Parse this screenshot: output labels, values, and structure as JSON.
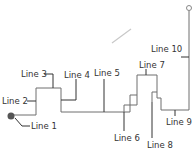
{
  "diagram": {
    "colors": {
      "line": "#6e6e6e",
      "leader": "#333333",
      "label": "#333333",
      "start_dot": "#555555",
      "end_circle": "#888888",
      "stray_stroke": "#c8c8c8"
    },
    "labels": [
      {
        "id": "line-1",
        "text": "Line 1"
      },
      {
        "id": "line-2",
        "text": "Line 2"
      },
      {
        "id": "line-3",
        "text": "Line 3"
      },
      {
        "id": "line-4",
        "text": "Line 4"
      },
      {
        "id": "line-5",
        "text": "Line 5"
      },
      {
        "id": "line-6",
        "text": "Line 6"
      },
      {
        "id": "line-7",
        "text": "Line 7"
      },
      {
        "id": "line-8",
        "text": "Line 8"
      },
      {
        "id": "line-9",
        "text": "Line 9"
      },
      {
        "id": "line-10",
        "text": "Line 10"
      }
    ]
  }
}
